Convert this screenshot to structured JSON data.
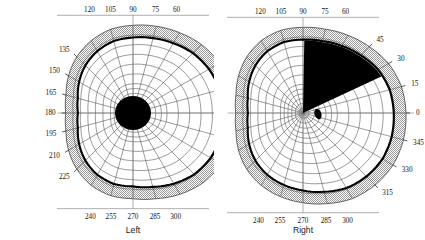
{
  "figure": {
    "background_color": "#ffffff",
    "panels": [
      "left",
      "right"
    ]
  },
  "colors": {
    "grid_line": "#4a4a4a",
    "isopter_line": "#000000",
    "scotoma_fill": "#000000",
    "shaded_band": "#d4d4d4",
    "axis_line": "#8c8c8c",
    "label_text": "#121212",
    "page_background": "#ffffff"
  },
  "left_panel": {
    "caption": "Left",
    "center_x": 133,
    "center_y": 113,
    "outer_radius": 104,
    "ring_count": 12,
    "spoke_step_degrees": 15,
    "edge_labels": [
      "135",
      "150",
      "165",
      "180",
      "195",
      "210",
      "225"
    ],
    "top_labels": [
      "120",
      "105",
      "90",
      "75",
      "60"
    ],
    "bottom_labels": [
      "240",
      "255",
      "270",
      "285",
      "300"
    ],
    "scotoma": {
      "type": "circle",
      "label": "central-scotoma",
      "cx": 133,
      "cy": 113,
      "rx": 18,
      "ry": 17
    }
  },
  "right_panel": {
    "caption": "Right",
    "center_x": 303,
    "center_y": 113,
    "outer_radius": 104,
    "ring_count": 12,
    "spoke_step_degrees": 15,
    "edge_labels": [
      "45",
      "30",
      "15",
      "0",
      "345",
      "330",
      "315"
    ],
    "top_labels": [
      "120",
      "105",
      "90",
      "75",
      "60"
    ],
    "bottom_labels": [
      "240",
      "255",
      "270",
      "285",
      "300"
    ],
    "scotoma": {
      "type": "wedge",
      "label": "superior-temporal-wedge-defect",
      "start_angle_deg": 90,
      "end_angle_deg": 25,
      "apex_x": 303,
      "apex_y": 113
    },
    "blind_spot": {
      "type": "oval",
      "label": "physiologic-blind-spot",
      "cx": 318,
      "cy": 114,
      "rx": 3.4,
      "ry": 5.4,
      "rotation_deg": -18
    }
  },
  "chart_data": {
    "type": "line",
    "subtitle": "Goldmann-style kinetic perimetry, left and right eye",
    "xlabel": "",
    "ylabel": "",
    "grid": true,
    "legend_position": "none",
    "coordinate_system": "polar",
    "angle_unit": "degrees",
    "radius_unit": "degrees of eccentricity",
    "ring_radii_degrees": [
      5,
      10,
      15,
      20,
      25,
      30,
      40,
      50,
      60,
      70,
      80,
      90
    ],
    "angle_ticks": [
      0,
      15,
      30,
      45,
      60,
      75,
      90,
      105,
      120,
      135,
      150,
      165,
      180,
      195,
      210,
      225,
      240,
      255,
      270,
      285,
      300,
      315,
      330,
      345
    ],
    "series": [
      {
        "name": "Left eye isopter",
        "panel": "left",
        "angles": [
          0,
          15,
          30,
          45,
          60,
          75,
          90,
          105,
          120,
          135,
          150,
          165,
          180,
          195,
          210,
          225,
          240,
          255,
          270,
          285,
          300,
          315,
          330,
          345
        ],
        "values": [
          88,
          88,
          86,
          83,
          79,
          76,
          74,
          73,
          70,
          66,
          61,
          56,
          54,
          56,
          61,
          66,
          70,
          72,
          72,
          75,
          80,
          85,
          88,
          89
        ]
      },
      {
        "name": "Left eye normal-limit band outer edge",
        "panel": "left",
        "angles": [
          0,
          15,
          30,
          45,
          60,
          75,
          90,
          105,
          120,
          135,
          150,
          165,
          180,
          195,
          210,
          225,
          240,
          255,
          270,
          285,
          300,
          315,
          330,
          345
        ],
        "values": [
          100,
          100,
          98,
          95,
          91,
          88,
          86,
          85,
          82,
          78,
          73,
          68,
          66,
          68,
          73,
          78,
          82,
          84,
          84,
          87,
          92,
          97,
          100,
          101
        ]
      },
      {
        "name": "Right eye isopter",
        "panel": "right",
        "angles": [
          0,
          15,
          30,
          45,
          60,
          75,
          90,
          105,
          120,
          135,
          150,
          165,
          180,
          195,
          210,
          225,
          240,
          255,
          270,
          285,
          300,
          315,
          330,
          345
        ],
        "values": [
          89,
          88,
          85,
          80,
          76,
          73,
          72,
          72,
          70,
          66,
          61,
          56,
          54,
          56,
          61,
          66,
          70,
          73,
          76,
          80,
          85,
          88,
          90,
          90
        ]
      },
      {
        "name": "Right eye normal-limit band outer edge",
        "panel": "right",
        "angles": [
          0,
          15,
          30,
          45,
          60,
          75,
          90,
          105,
          120,
          135,
          150,
          165,
          180,
          195,
          210,
          225,
          240,
          255,
          270,
          285,
          300,
          315,
          330,
          345
        ],
        "values": [
          101,
          100,
          97,
          92,
          88,
          85,
          84,
          84,
          82,
          78,
          73,
          68,
          66,
          68,
          73,
          78,
          82,
          85,
          88,
          92,
          97,
          100,
          102,
          102
        ]
      }
    ],
    "annotations": [
      {
        "panel": "left",
        "kind": "scotoma",
        "shape": "circle",
        "description": "Dense central scotoma, left eye",
        "center_angle_deg": 0,
        "center_radius_deg": 0,
        "radius_deg": 15
      },
      {
        "panel": "right",
        "kind": "scotoma",
        "shape": "wedge",
        "description": "Dense superior temporal wedge defect, right eye",
        "start_angle_deg": 25,
        "end_angle_deg": 90,
        "inner_radius_deg": 0,
        "outer_radius_deg": 85
      },
      {
        "panel": "right",
        "kind": "blind-spot",
        "shape": "oval",
        "description": "Physiologic blind spot, right eye",
        "center_angle_deg": 3,
        "center_radius_deg": 15
      }
    ]
  }
}
